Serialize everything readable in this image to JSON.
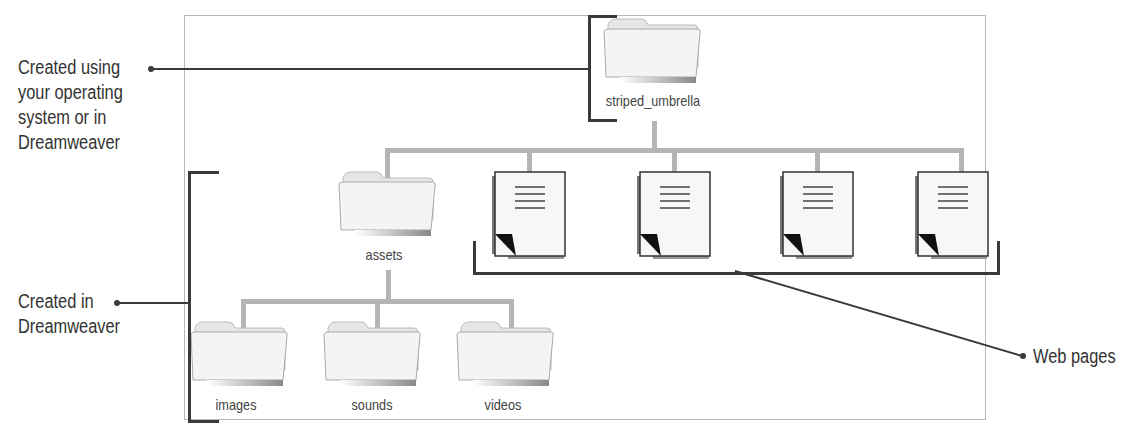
{
  "diagram": {
    "root_folder": {
      "name": "striped_umbrella"
    },
    "child_folder": {
      "name": "assets"
    },
    "subfolders": [
      {
        "name": "images"
      },
      {
        "name": "sounds"
      },
      {
        "name": "videos"
      }
    ],
    "web_pages_count": 4
  },
  "callouts": {
    "root": {
      "lines": [
        "Created using",
        "your operating",
        "system or in",
        "Dreamweaver"
      ]
    },
    "sub": {
      "lines": [
        "Created in",
        "Dreamweaver"
      ]
    },
    "pages": {
      "text": "Web pages"
    }
  },
  "colors": {
    "connector": "#b5b5b5",
    "bracket": "#3a3a3a",
    "frame": "#b8b8b8"
  }
}
